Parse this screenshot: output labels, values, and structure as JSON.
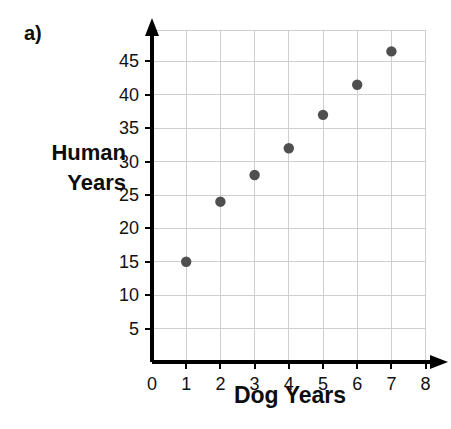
{
  "part_label": "a)",
  "axis_titles": {
    "y_line1": "Human",
    "y_line2": "Years",
    "x": "Dog Years"
  },
  "chart_data": {
    "type": "scatter",
    "title": "",
    "xlabel": "Dog Years",
    "ylabel": "Human Years",
    "xlim": [
      0,
      8
    ],
    "ylim": [
      0,
      48.5
    ],
    "grid": true,
    "legend": "none",
    "x_ticks": [
      "0",
      "1",
      "2",
      "3",
      "4",
      "5",
      "6",
      "7",
      "8"
    ],
    "y_ticks": [
      "5",
      "10",
      "15",
      "20",
      "25",
      "30",
      "35",
      "40",
      "45"
    ],
    "x": [
      1,
      2,
      3,
      4,
      5,
      6,
      7
    ],
    "y": [
      15,
      24,
      28,
      32,
      37,
      41.5,
      46.5
    ],
    "points": [
      {
        "x": 1,
        "y": 15
      },
      {
        "x": 2,
        "y": 24
      },
      {
        "x": 3,
        "y": 28
      },
      {
        "x": 4,
        "y": 32
      },
      {
        "x": 5,
        "y": 37
      },
      {
        "x": 6,
        "y": 41.5
      },
      {
        "x": 7,
        "y": 46.5
      }
    ],
    "marker_color": "#4f4f4f",
    "grid_color": "#cfcfcf",
    "axis_color": "#000000"
  }
}
